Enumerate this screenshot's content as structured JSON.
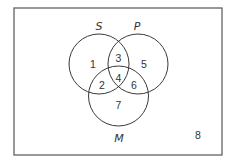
{
  "diagram": {
    "type": "venn",
    "sets": [
      {
        "id": "S",
        "label": "S"
      },
      {
        "id": "P",
        "label": "P"
      },
      {
        "id": "M",
        "label": "M"
      }
    ],
    "regions": [
      {
        "id": "1",
        "label": "1",
        "membership": "S only"
      },
      {
        "id": "2",
        "label": "2",
        "membership": "S and M only"
      },
      {
        "id": "3",
        "label": "3",
        "membership": "S and P only"
      },
      {
        "id": "4",
        "label": "4",
        "membership": "S, P and M"
      },
      {
        "id": "5",
        "label": "5",
        "membership": "P only"
      },
      {
        "id": "6",
        "label": "6",
        "membership": "P and M only"
      },
      {
        "id": "7",
        "label": "7",
        "membership": "M only"
      },
      {
        "id": "8",
        "label": "8",
        "membership": "outside all sets"
      }
    ],
    "colors": {
      "stroke": "#3a3a3a",
      "frame": "#555555",
      "text": "#333333",
      "background": "#ffffff"
    }
  }
}
